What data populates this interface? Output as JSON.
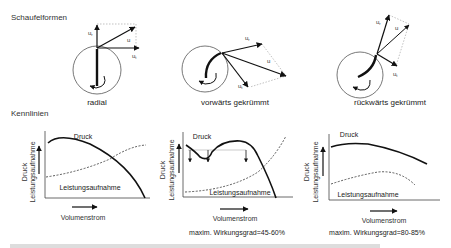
{
  "sections": {
    "blade_shapes_title": "Schaufelformen",
    "characteristics_title": "Kennlinien"
  },
  "blade_diagrams": [
    {
      "name": "radial",
      "caption": "radial",
      "labels": {
        "radial": "u",
        "radial_sub": "r",
        "resultant": "u",
        "tangential": "u",
        "tangential_sub": "t"
      }
    },
    {
      "name": "forward-curved",
      "caption": "vorwärts gekrümmt",
      "labels": {
        "radial": "u",
        "radial_sub": "r",
        "resultant": "u",
        "tangential": "u",
        "tangential_sub": "t"
      }
    },
    {
      "name": "backward-curved",
      "caption": "rückwärts gekrümmt",
      "labels": {
        "radial": "u",
        "radial_sub": "r",
        "resultant": "u",
        "tangential": "u",
        "tangential_sub": "t"
      }
    }
  ],
  "charts": [
    {
      "ylabel_line1": "Druck",
      "ylabel_line2": "Leistungsaufnahme",
      "xlabel": "Volumenstrom",
      "pressure_label": "Druck",
      "power_label": "Leistungsaufnahme",
      "efficiency": ""
    },
    {
      "ylabel_line1": "Druck",
      "ylabel_line2": "Leistungsaufnahme",
      "xlabel": "Volumenstrom",
      "pressure_label": "Druck",
      "power_label": "Leistungsaufnahme",
      "efficiency": "maxim. Wirkungsgrad=45-60%"
    },
    {
      "ylabel_line1": "Druck",
      "ylabel_line2": "Leistungsaufnahme",
      "xlabel": "Volumenstrom",
      "pressure_label": "Druck",
      "power_label": "Leistungsaufnahme",
      "efficiency": "maxim. Wirkungsgrad=80-85%"
    }
  ],
  "colors": {
    "line": "#111111",
    "thin": "#444444",
    "dotted": "#888888"
  }
}
